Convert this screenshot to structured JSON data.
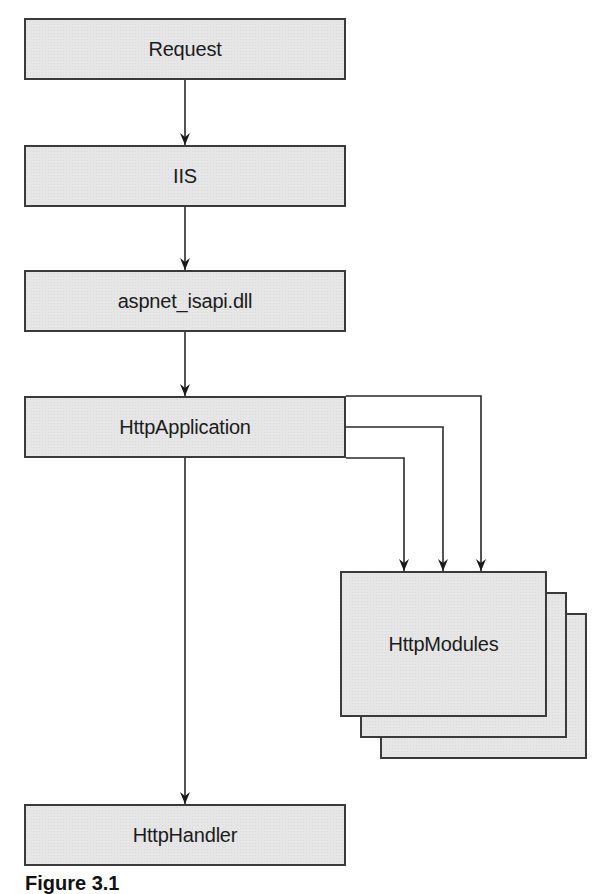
{
  "diagram": {
    "type": "flow",
    "nodes": [
      {
        "id": "request",
        "label": "Request"
      },
      {
        "id": "iis",
        "label": "IIS"
      },
      {
        "id": "aspnet_isapi",
        "label": "aspnet_isapi.dll"
      },
      {
        "id": "http_application",
        "label": "HttpApplication"
      },
      {
        "id": "http_modules",
        "label": "HttpModules",
        "stacked": true,
        "stack_count": 3
      },
      {
        "id": "http_handler",
        "label": "HttpHandler"
      }
    ],
    "edges": [
      {
        "from": "request",
        "to": "iis"
      },
      {
        "from": "iis",
        "to": "aspnet_isapi"
      },
      {
        "from": "aspnet_isapi",
        "to": "http_application"
      },
      {
        "from": "http_application",
        "to": "http_modules",
        "count": 3
      },
      {
        "from": "http_application",
        "to": "http_handler"
      }
    ],
    "colors": {
      "box_fill": "#e6e6e6",
      "box_border": "#3a3a3a",
      "line": "#2a2a2a",
      "background": "#ffffff"
    }
  },
  "caption": "Figure 3.1"
}
